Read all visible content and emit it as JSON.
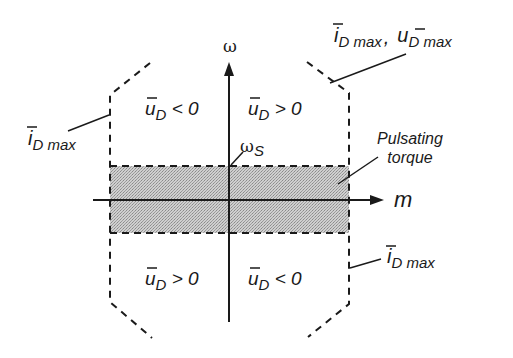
{
  "diagram": {
    "axes": {
      "vertical_label": "ω",
      "horizontal_label": "m",
      "origin_marker_label": "ω",
      "origin_marker_sub": "S"
    },
    "quadrants": {
      "top_left": {
        "var": "u",
        "sub": "D",
        "rel": " < 0"
      },
      "top_right": {
        "var": "u",
        "sub": "D",
        "rel": " > 0"
      },
      "bottom_left": {
        "var": "u",
        "sub": "D",
        "rel": " > 0"
      },
      "bottom_right": {
        "var": "u",
        "sub": "D",
        "rel": " < 0"
      }
    },
    "annotations": {
      "left_limit": {
        "var": "i",
        "sub": "D max"
      },
      "right_limit": {
        "var": "i",
        "sub": "D max"
      },
      "corner_limit": {
        "var1": "i",
        "sub1": "D max",
        "sep": ",",
        "var2": "u",
        "sub2": "D max"
      },
      "band_label_line1": "Pulsating",
      "band_label_line2": "torque"
    },
    "colors": {
      "ink": "#1a1a1a",
      "band_fill": "#c4c4c4"
    }
  }
}
